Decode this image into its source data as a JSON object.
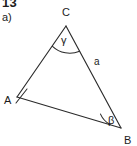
{
  "page": {
    "background_color": "#ffffff",
    "ink_color": "#2b2b2b",
    "text_color": "#1c1c1c",
    "width": 137,
    "height": 146
  },
  "header": {
    "problem_number": "13",
    "part_label": "a)"
  },
  "figure": {
    "type": "triangle",
    "vertices": [
      {
        "name": "C",
        "label": "C",
        "x": 66,
        "y": 26,
        "label_x": 66,
        "label_y": 14
      },
      {
        "name": "A",
        "label": "A",
        "x": 17,
        "y": 97,
        "label_x": 9,
        "label_y": 104
      },
      {
        "name": "B",
        "label": "B",
        "x": 121,
        "y": 128,
        "label_x": 127,
        "label_y": 142
      }
    ],
    "sides": [
      {
        "name": "side-a",
        "label": "a",
        "from": "C",
        "to": "B",
        "label_x": 97,
        "label_y": 62
      },
      {
        "name": "side-b",
        "label": "",
        "from": "A",
        "to": "C",
        "label_x": 0,
        "label_y": 0
      },
      {
        "name": "side-c",
        "label": "",
        "from": "A",
        "to": "B",
        "label_x": 0,
        "label_y": 0
      }
    ],
    "angles": [
      {
        "name": "angle-gamma",
        "vertex": "C",
        "label": "γ",
        "label_x": 65,
        "label_y": 42
      },
      {
        "name": "angle-beta",
        "vertex": "B",
        "label": "β",
        "label_x": 112,
        "label_y": 122
      }
    ],
    "marks": [
      {
        "name": "vertex-tick-a",
        "at": "A"
      }
    ]
  }
}
